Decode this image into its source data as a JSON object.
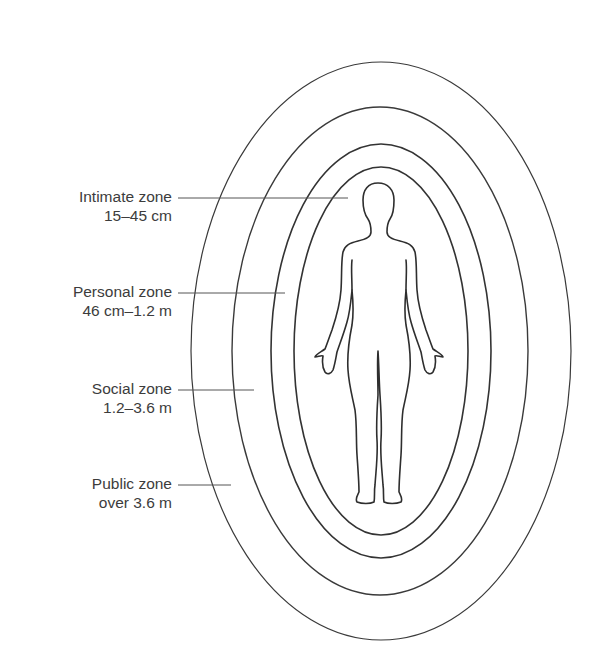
{
  "diagram": {
    "type": "proxemics-zones",
    "colors": {
      "line": "#3a3a3a",
      "leader": "#555555",
      "text": "#3c3c3c",
      "background": "#ffffff"
    },
    "zones": [
      {
        "id": "intimate",
        "name": "Intimate zone",
        "range": "15–45 cm"
      },
      {
        "id": "personal",
        "name": "Personal zone",
        "range": "46 cm–1.2 m"
      },
      {
        "id": "social",
        "name": "Social zone",
        "range": "1.2–3.6 m"
      },
      {
        "id": "public",
        "name": "Public zone",
        "range": "over 3.6 m"
      }
    ]
  }
}
